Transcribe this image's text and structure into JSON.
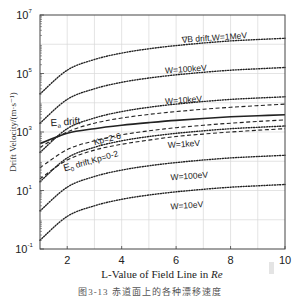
{
  "chart_data": {
    "type": "line",
    "title": "",
    "xlabel": "L-Value of Field Line in Re",
    "xlabel_plain": "L-Value of Field Line in ",
    "xlabel_italic": "Re",
    "ylabel": "Drift Velocity/(m·s⁻¹)",
    "caption": "图3-13   赤道面上的各种漂移速度",
    "xlim": [
      1,
      10
    ],
    "ylim_log10": [
      -1,
      7
    ],
    "yscale": "log",
    "grid": true,
    "x_ticks": [
      2,
      4,
      6,
      8,
      10
    ],
    "y_ticks": [
      {
        "base": "10",
        "exp": "-1"
      },
      {
        "base": "10",
        "exp": "1"
      },
      {
        "base": "10",
        "exp": "3"
      },
      {
        "base": "10",
        "exp": "5"
      },
      {
        "base": "10",
        "exp": "7"
      }
    ],
    "x": [
      1,
      2,
      3,
      4,
      5,
      6,
      7,
      8,
      9,
      10
    ],
    "series": [
      {
        "name": "∇B drift, W=1MeV",
        "style": "dotted",
        "values": [
          20000,
          130000,
          300000,
          500000,
          700000,
          900000,
          1100000,
          1300000,
          1450000,
          1600000
        ]
      },
      {
        "name": "W=100keV",
        "style": "dotted",
        "values": [
          2000,
          13000,
          30000,
          50000,
          70000,
          90000,
          110000,
          130000,
          145000,
          160000
        ]
      },
      {
        "name": "W=10keV",
        "style": "dotted",
        "values": [
          200,
          1300,
          3000,
          5000,
          7000,
          9000,
          11000,
          13000,
          14500,
          16000
        ]
      },
      {
        "name": "W=1keV",
        "style": "dotted",
        "values": [
          20,
          130,
          300,
          500,
          700,
          900,
          1100,
          1300,
          1450,
          1600
        ]
      },
      {
        "name": "W=100eV",
        "style": "dotted",
        "values": [
          2,
          13,
          30,
          50,
          70,
          90,
          110,
          130,
          145,
          160
        ]
      },
      {
        "name": "W=10eV",
        "style": "dotted",
        "values": [
          0.2,
          1.3,
          3,
          5,
          7,
          9,
          11,
          13,
          14.5,
          16
        ]
      },
      {
        "name": "E drift",
        "style": "solid",
        "values": [
          400,
          900,
          1300,
          1700,
          2100,
          2500,
          2900,
          3300,
          3600,
          3900
        ]
      },
      {
        "name": "Kp=2-6 (upper)",
        "style": "dashed",
        "values": [
          300,
          1000,
          2000,
          3000,
          4000,
          5000,
          6000,
          7000,
          8000,
          9000
        ]
      },
      {
        "name": "Kp=2-6 (lower)",
        "style": "dashed",
        "values": [
          60,
          250,
          500,
          800,
          1100,
          1400,
          1700,
          2000,
          2300,
          2600
        ]
      },
      {
        "name": "E0 drift, Kp=0-2",
        "style": "dashed",
        "values": [
          25,
          110,
          240,
          380,
          530,
          700,
          850,
          1000,
          1150,
          1300
        ]
      }
    ],
    "annotations": [
      {
        "text": "∇B drift,W=1MeV",
        "x": 6.2,
        "y_log": 6.05
      },
      {
        "text": "W=100keV",
        "x": 5.6,
        "y_log": 5.0
      },
      {
        "text": "W=10keV",
        "x": 5.6,
        "y_log": 3.95
      },
      {
        "text": "E",
        "sub": "a",
        "rest": " drift",
        "x": 1.4,
        "y_log": 3.2
      },
      {
        "text": "Kp=2-6",
        "x": 3.0,
        "y_log": 2.55
      },
      {
        "text": "E",
        "sub": "0",
        "rest": " drift,Kp=0-2",
        "x": 1.9,
        "y_log": 1.65
      },
      {
        "text": "W=1keV",
        "x": 5.7,
        "y_log": 2.45
      },
      {
        "text": "W=100eV",
        "x": 5.8,
        "y_log": 1.35
      },
      {
        "text": "W=10eV",
        "x": 5.8,
        "y_log": 0.35
      }
    ]
  },
  "watermark": {
    "visible": true
  }
}
